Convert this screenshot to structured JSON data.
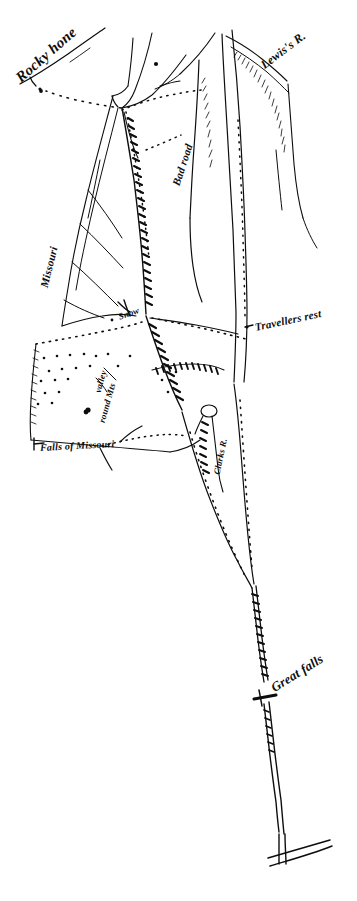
{
  "document": {
    "title": "Hand-drawn exploration route map sketch",
    "medium": "pen and ink on paper",
    "background_color": "#ffffff",
    "ink_color": "#0d0d0d",
    "width_px": 357,
    "height_px": 901
  },
  "labels": [
    {
      "id": "rocky-mountains",
      "text": "Rocky hone",
      "x": 18,
      "y": 72,
      "rotation": -41,
      "font_size": 15
    },
    {
      "id": "lewiss-river",
      "text": "Lewis's R.",
      "x": 262,
      "y": 60,
      "rotation": -37,
      "font_size": 12
    },
    {
      "id": "bad-road",
      "text": "Bad road",
      "x": 176,
      "y": 180,
      "rotation": -72,
      "font_size": 11
    },
    {
      "id": "missouri-river",
      "text": "Missouri",
      "x": 44,
      "y": 282,
      "rotation": -76,
      "font_size": 11
    },
    {
      "id": "snow-pass",
      "text": "Snow",
      "x": 119,
      "y": 313,
      "rotation": -20,
      "font_size": 9
    },
    {
      "id": "travellers-rest",
      "text": "Travellers rest",
      "x": 255,
      "y": 322,
      "rotation": -12,
      "font_size": 11
    },
    {
      "id": "valley",
      "text": "valley",
      "x": 98,
      "y": 388,
      "rotation": -74,
      "font_size": 9
    },
    {
      "id": "round-mountains",
      "text": "round Mts",
      "x": 102,
      "y": 418,
      "rotation": -74,
      "font_size": 9
    },
    {
      "id": "clarks-river",
      "text": "Clarks R.",
      "x": 217,
      "y": 470,
      "rotation": -78,
      "font_size": 9
    },
    {
      "id": "falls-of-missouri",
      "text": "Falls of Missouri",
      "x": 40,
      "y": 443,
      "rotation": -3,
      "font_size": 10
    },
    {
      "id": "great-falls",
      "text": "Great falls",
      "x": 272,
      "y": 682,
      "rotation": -32,
      "font_size": 13
    }
  ],
  "features": {
    "rivers": [
      "Lewis's R.",
      "Missouri",
      "Clarks R."
    ],
    "landmarks": [
      "Rocky hone",
      "Travellers rest",
      "Falls of Missouri",
      "Great falls",
      "valley",
      "round Mts"
    ],
    "route_notes": [
      "Bad road",
      "Snow"
    ]
  }
}
